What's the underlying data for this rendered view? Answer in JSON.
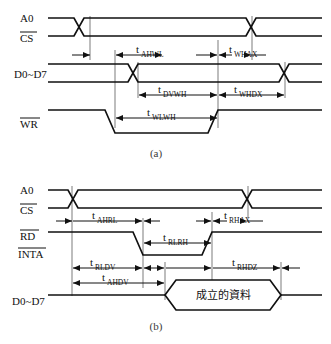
{
  "figure": {
    "background_color": "#ffffff",
    "line_color": "#111111"
  },
  "diagram_a": {
    "caption": "(a)",
    "signals": [
      {
        "name": "A0",
        "label": "A0",
        "overline": false
      },
      {
        "name": "CS",
        "label": "CS",
        "overline": true
      },
      {
        "name": "D0~D7",
        "label": "D0~D7",
        "overline": false
      },
      {
        "name": "WR",
        "label": "WR",
        "overline": true
      }
    ],
    "timings": [
      {
        "name": "t_AHWL",
        "base": "t",
        "sub": "AHWL"
      },
      {
        "name": "t_WHAX",
        "base": "t",
        "sub": "WHAX"
      },
      {
        "name": "t_DVWH",
        "base": "t",
        "sub": "DVWH"
      },
      {
        "name": "t_WHDX",
        "base": "t",
        "sub": "WHDX"
      },
      {
        "name": "t_WLWH",
        "base": "t",
        "sub": "WLWH"
      }
    ]
  },
  "diagram_b": {
    "caption": "(b)",
    "signals": [
      {
        "name": "A0",
        "label": "A0",
        "overline": false
      },
      {
        "name": "CS",
        "label": "CS",
        "overline": true
      },
      {
        "name": "RD",
        "label": "RD",
        "overline": true
      },
      {
        "name": "INTA",
        "label": "INTA",
        "overline": true
      },
      {
        "name": "D0~D7",
        "label": "D0~D7",
        "overline": false
      }
    ],
    "timings": [
      {
        "name": "t_AHRL",
        "base": "t",
        "sub": "AHRL"
      },
      {
        "name": "t_RLRH",
        "base": "t",
        "sub": "RLRH"
      },
      {
        "name": "t_RHAX",
        "base": "t",
        "sub": "RHAX"
      },
      {
        "name": "t_RLDV",
        "base": "t",
        "sub": "RLDV"
      },
      {
        "name": "t_AHDV",
        "base": "t",
        "sub": "AHDV"
      },
      {
        "name": "t_RHDZ",
        "base": "t",
        "sub": "RHDZ"
      }
    ],
    "data_valid_label": "成立的資料"
  }
}
